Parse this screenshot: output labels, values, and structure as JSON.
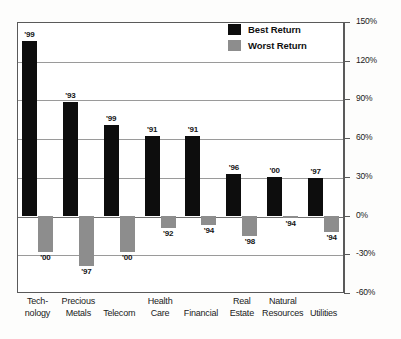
{
  "legend": {
    "position": "top-right",
    "items": [
      {
        "label": "Best Return",
        "color": "#0d0d0d",
        "swatch": "best-return-swatch"
      },
      {
        "label": "Worst Return",
        "color": "#8d8d8d",
        "swatch": "worst-return-swatch"
      }
    ]
  },
  "chart_data": {
    "type": "bar",
    "title": "",
    "subtitle": "",
    "xlabel": "",
    "ylabel": "",
    "ylim": [
      -60,
      150
    ],
    "grid": true,
    "legend_position": "top-right",
    "ytick_labels": [
      "150%",
      "120%",
      "90%",
      "60%",
      "30%",
      "0%",
      "-30%",
      "-60%"
    ],
    "ytick_values": [
      150,
      120,
      90,
      60,
      30,
      0,
      -30,
      -60
    ],
    "categories": [
      "Technology",
      "Precious Metals",
      "Telecom",
      "Health Care",
      "Financial",
      "Real Estate",
      "Natural Resources",
      "Utilities"
    ],
    "category_lines": [
      [
        "Tech-",
        "nology"
      ],
      [
        "Precious",
        "Metals"
      ],
      [
        "",
        "Telecom"
      ],
      [
        "Health",
        "Care"
      ],
      [
        "",
        "Financial"
      ],
      [
        "Real",
        "Estate"
      ],
      [
        "Natural",
        "Resources"
      ],
      [
        "",
        "Utilities"
      ]
    ],
    "series": [
      {
        "name": "Best Return",
        "color": "#0d0d0d",
        "values": [
          135,
          88,
          70,
          62,
          62,
          32,
          30,
          29
        ],
        "annotations": [
          "'99",
          "'93",
          "'99",
          "'91",
          "'91",
          "'96",
          "'00",
          "'97"
        ]
      },
      {
        "name": "Worst Return",
        "color": "#8d8d8d",
        "values": [
          -28,
          -39,
          -28,
          -10,
          -7,
          -16,
          -2,
          -13
        ],
        "annotations": [
          "'00",
          "'97",
          "'00",
          "'92",
          "'94",
          "'98",
          "'94",
          "'94"
        ]
      }
    ]
  }
}
